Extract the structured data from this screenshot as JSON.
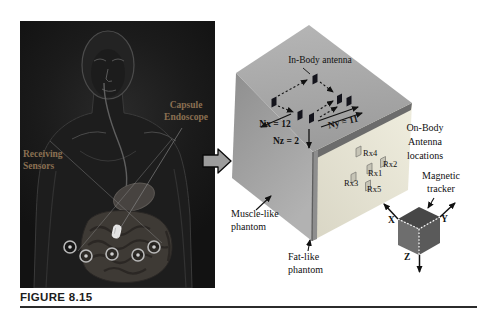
{
  "caption": "FIGURE 8.15",
  "photo": {
    "capsule_label": [
      "Capsule",
      "Endoscope"
    ],
    "receiving_label": [
      "Receiving",
      "Sensors"
    ],
    "label_color": "#8a7052"
  },
  "diagram": {
    "in_body_antenna": "In-Body antenna",
    "nx": "Nx = 12",
    "ny": "Ny = 11",
    "nz": "Nz = 2",
    "on_body": [
      "On-Body",
      "Antenna",
      "locations"
    ],
    "rx": [
      "Rx4",
      "Rx2",
      "Rx1",
      "Rx3",
      "Rx5"
    ],
    "muscle": [
      "Muscle-like",
      "phantom"
    ],
    "fat": [
      "Fat-like",
      "phantom"
    ],
    "magnetic": [
      "Magnetic",
      "tracker"
    ],
    "axes": {
      "x": "X",
      "y": "Y",
      "z": "Z"
    },
    "colors": {
      "top_face": "#a5a5a5",
      "muscle_face": "#9b9b9b",
      "fat_face": "#e8e5d6",
      "fat_edge_stripe": "#6c6c6c",
      "in_body_antenna": "#14141c",
      "on_body_antenna": "#c6c4b6",
      "tracker_top": "#474747",
      "tracker_left": "#6e6e6e",
      "tracker_right": "#5a5a5a"
    }
  }
}
